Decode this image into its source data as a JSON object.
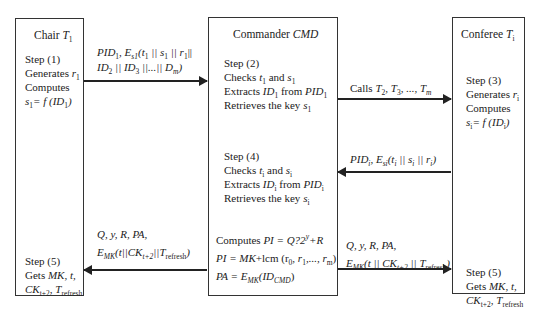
{
  "entities": {
    "chair": {
      "title": "Chair",
      "symbol": "T",
      "symbol_sub": "1"
    },
    "commander": {
      "title": "Commander",
      "symbol": "CMD"
    },
    "conferee": {
      "title": "Conferee",
      "symbol": "T",
      "symbol_sub": "i"
    }
  },
  "chair": {
    "step1": {
      "label": "Step (1)",
      "line1": "Generates",
      "r": "r",
      "r_sub": "1",
      "line2": "Computes",
      "formula": "s",
      "formula_sub": "1",
      "formula_rest": "= f (ID",
      "formula_id_sub": "1",
      "formula_end": ")"
    },
    "step5": {
      "label": "Step (5)",
      "line1": "Gets",
      "mk": "MK, t,",
      "ck": "CK",
      "ck_sub": "t+2",
      "comma": ",",
      "t": "T",
      "t_sub": "refresh"
    }
  },
  "commander": {
    "step2": {
      "label": "Step (2)",
      "checks": "Checks",
      "t": "t",
      "t_sub": "1",
      "and": "and",
      "s": "s",
      "s_sub": "1",
      "extracts": "Extracts",
      "id": "ID",
      "id_sub": "1",
      "from": "from",
      "pid": "PID",
      "pid_sub": "1",
      "retrieves": "Retrieves the key",
      "key": "s",
      "key_sub": "1"
    },
    "step4": {
      "label": "Step (4)",
      "checks": "Checks",
      "t": "t",
      "t_sub": "i",
      "and": "and",
      "s": "s",
      "s_sub": "i",
      "extracts": "Extracts",
      "id": "ID",
      "id_sub": "i",
      "from": "from",
      "pid": "PID",
      "pid_sub": "i",
      "retrieves": "Retrieves the key",
      "key": "s",
      "key_sub": "i"
    },
    "compute": {
      "line1_a": "Computes",
      "line1_b": "PI = Q?2",
      "line1_sup": "y",
      "line1_c": "+R",
      "line2_a": "PI = MK",
      "line2_b": "+lcm (r",
      "line2_sub0": "0",
      "line2_c": ", r",
      "line2_sub1": "1",
      "line2_d": ",..., r",
      "line2_subm": "m",
      "line2_e": ")",
      "line3_a": "PA = E",
      "line3_sub": "MK",
      "line3_b": "(ID",
      "line3_sub2": "CMD",
      "line3_c": ")"
    }
  },
  "conferee": {
    "step3": {
      "label": "Step (3)",
      "line1": "Generates",
      "r": "r",
      "r_sub": "i",
      "line2": "Computes",
      "formula": "s",
      "formula_sub": "i",
      "formula_rest": "= f (ID",
      "formula_id_sub": "i",
      "formula_end": ")"
    },
    "step5": {
      "label": "Step (5)",
      "line1": "Gets",
      "mk": "MK, t,",
      "ck": "CK",
      "ck_sub": "t+2",
      "comma": ",",
      "t": "T",
      "t_sub": "refresh"
    }
  },
  "messages": {
    "m1": {
      "a": "PID",
      "a_sub": "1",
      "b": ", E",
      "b_sub": "s1",
      "c": "(t",
      "c_sub": "1",
      "d": " || s",
      "d_sub": "1",
      "e": " || r",
      "e_sub": "1",
      "f": "||",
      "g": "ID",
      "g_sub": "2",
      "h": " || ID",
      "h_sub": "3",
      "i": " ||...|| D",
      "i_sub": "m",
      "j": ")"
    },
    "m2": {
      "a": "Calls",
      "b": "T",
      "b_sub": "2",
      "c": ", T",
      "c_sub": "3",
      "d": ", ..., T",
      "d_sub": "m"
    },
    "m3": {
      "a": "PID",
      "a_sub": "i",
      "b": ", E",
      "b_sub": "si",
      "c": "(t",
      "c_sub": "i",
      "d": " || s",
      "d_sub": "i",
      "e": " || r",
      "e_sub": "i",
      "f": ")"
    },
    "m4": {
      "line1": "Q, y, R, PA,",
      "a": "E",
      "a_sub": "MK",
      "b": "(t||CK",
      "b_sub": "t+2",
      "c": "||T",
      "c_sub": "refresh",
      "d": ")"
    },
    "m5": {
      "line1": "Q, y, R, PA,",
      "a": "E",
      "a_sub": "MK",
      "b": "(t || CK",
      "b_sub": "t+2",
      "c": " || T",
      "c_sub": "refresh",
      "d": ")"
    }
  }
}
